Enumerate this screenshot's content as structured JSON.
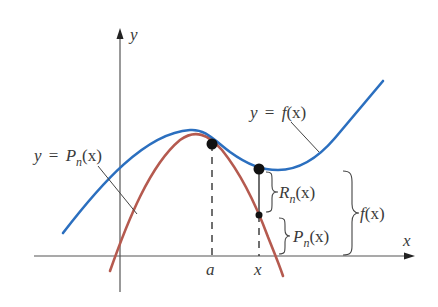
{
  "diagram": {
    "axes": {
      "x_label": "x",
      "y_label": "y"
    },
    "tick_labels": {
      "a": "a",
      "x": "x"
    },
    "curves": [
      {
        "id": "f",
        "label_lhs": "y",
        "label_eq": "=",
        "label_fn": "f",
        "label_arg": "(x)",
        "color": "#2b6fbf"
      },
      {
        "id": "Pn",
        "label_lhs": "y",
        "label_eq": "=",
        "label_fn": "P",
        "label_sub": "n",
        "label_arg": "(x)",
        "color": "#b55a4f"
      }
    ],
    "braces": {
      "remainder": {
        "fn": "R",
        "sub": "n",
        "arg": "(x)"
      },
      "polynomial": {
        "fn": "P",
        "sub": "n",
        "arg": "(x)"
      },
      "function": {
        "fn": "f",
        "arg": "(x)"
      }
    },
    "colors": {
      "axis": "#555555",
      "f_curve": "#2b6fbf",
      "pn_curve": "#b55a4f",
      "point": "#111111",
      "text": "#3a3a3a"
    }
  }
}
